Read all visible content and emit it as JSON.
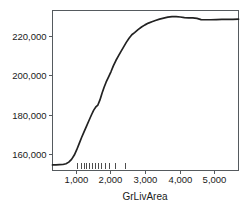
{
  "chart_data": {
    "type": "line",
    "title": "",
    "subtitle": "",
    "xlabel": "GrLivArea",
    "ylabel": "",
    "xlim": [
      330,
      5700
    ],
    "ylim": [
      152000,
      233000
    ],
    "grid": false,
    "legend": null,
    "x_ticks": [
      {
        "value": 1000,
        "label": "1,000"
      },
      {
        "value": 2000,
        "label": "2,000"
      },
      {
        "value": 3000,
        "label": "3,000"
      },
      {
        "value": 4000,
        "label": "4,000"
      },
      {
        "value": 5000,
        "label": "5,000"
      }
    ],
    "y_ticks": [
      {
        "value": 160000,
        "label": "160,000"
      },
      {
        "value": 180000,
        "label": "180,000"
      },
      {
        "value": 200000,
        "label": "200,000"
      },
      {
        "value": 220000,
        "label": "220,000"
      }
    ],
    "series": [
      {
        "name": "partial dependence",
        "x": [
          330,
          430,
          530,
          630,
          720,
          800,
          880,
          960,
          1030,
          1100,
          1170,
          1240,
          1310,
          1380,
          1450,
          1520,
          1590,
          1640,
          1700,
          1760,
          1820,
          1880,
          1950,
          2020,
          2090,
          2160,
          2230,
          2300,
          2380,
          2460,
          2540,
          2620,
          2700,
          2800,
          2900,
          3000,
          3100,
          3200,
          3300,
          3420,
          3540,
          3660,
          3780,
          3900,
          4020,
          4140,
          4260,
          4380,
          4500,
          4620,
          4740,
          4900,
          5060,
          5220,
          5380,
          5540,
          5700
        ],
        "y": [
          154600,
          154600,
          154700,
          154800,
          155200,
          156000,
          157400,
          159600,
          162300,
          165400,
          168500,
          171400,
          174200,
          177000,
          179800,
          182400,
          184200,
          185000,
          187600,
          191000,
          194000,
          196700,
          199300,
          202000,
          205000,
          207600,
          209800,
          212000,
          214400,
          216800,
          218900,
          220700,
          221800,
          223300,
          224600,
          225700,
          226600,
          227300,
          227900,
          228600,
          229100,
          229600,
          229900,
          229900,
          229700,
          229400,
          229300,
          229300,
          229000,
          228400,
          228300,
          228300,
          228400,
          228500,
          228500,
          228500,
          228600
        ]
      }
    ],
    "rug_values": [
      1050,
      1140,
      1230,
      1310,
      1390,
      1470,
      1550,
      1640,
      1740,
      1840,
      1960,
      2120,
      2420
    ]
  }
}
